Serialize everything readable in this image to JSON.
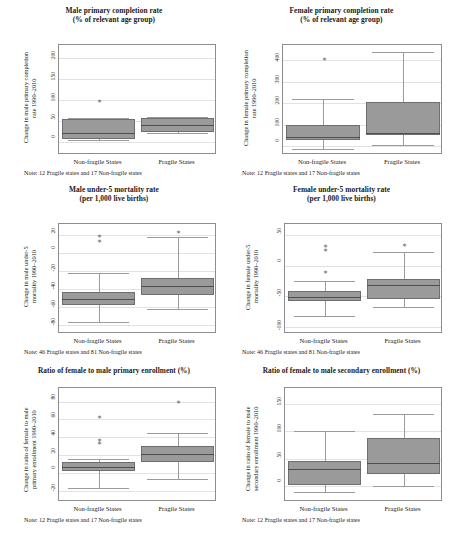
{
  "figure": {
    "panel_count": 6,
    "x_categories": [
      "Non-fragile States",
      "Fragile States"
    ],
    "box_fill_color": "#9a9a9a",
    "box_edge_color": "#6f6f6f",
    "gridline_color": "#e2e2e2",
    "axis_color": "#8d8d8d"
  },
  "panels": [
    {
      "id": "male-primary-completion-rate",
      "title_line1": "Male primary completion rate",
      "title_line2": "(% of relevant age group)",
      "ylabel": "Change in male primary completion\nrate 1990–2010",
      "note": "Note: 12 Fragile states and 17 Non-fragile states",
      "xlabels": [
        "Non-fragile States",
        "Fragile States"
      ]
    },
    {
      "id": "female-primary-completion-rate",
      "title_line1": "Female primary completion rate",
      "title_line2": "(% of relevant age group)",
      "ylabel": "Change in female primary completion\nrate 1990–2010",
      "note": "Note: 12 Fragile states and 17 Non-fragile states",
      "xlabels": [
        "Non-fragile States",
        "Fragile States"
      ]
    },
    {
      "id": "male-under5-mortality-rate",
      "title_line1": "Male under-5 mortality rate",
      "title_line2": "(per 1,000 live births)",
      "ylabel": "Change in male under-5\nmortality 1990–2010",
      "note": "Note: 46 Fragile states and 81 Non-fragile states",
      "xlabels": [
        "Non-fragile States",
        "Fragile States"
      ]
    },
    {
      "id": "female-under5-mortality-rate",
      "title_line1": "Female under-5 mortality rate",
      "title_line2": "(per 1,000 live births)",
      "ylabel": "Change in female under-5\nmortality 1990–2010",
      "note": "Note: 46 Fragile states and 81 Non-fragile states",
      "xlabels": [
        "Non-fragile States",
        "Fragile States"
      ]
    },
    {
      "id": "ratio-female-male-primary-enrollment",
      "title_line1": "Ratio of female to male primary enrollment (%)",
      "title_line2": "",
      "ylabel": "Change in ratio of female to male\nprimary enrollment 1990–2010",
      "note": "Note: 12 Fragile states and 17 Non-fragile states",
      "xlabels": [
        "Non-fragile States",
        "Fragile States"
      ]
    },
    {
      "id": "ratio-female-male-secondary-enrollment",
      "title_line1": "Ratio of female to male secondary enrollment (%)",
      "title_line2": "",
      "ylabel": "Change in ratio of female to male\nsecondary enrollment 1990–2010",
      "note": "Note: 12 Fragile states and 17 Non-fragile states",
      "xlabels": [
        "Non-fragile States",
        "Fragile States"
      ]
    }
  ],
  "chart_data": [
    {
      "type": "box",
      "title": "Male primary completion rate (% of relevant age group)",
      "xlabel": "",
      "ylabel": "Change in male primary completion rate 1990–2010",
      "ticks": [
        0,
        50,
        100,
        150,
        200
      ],
      "ylim": [
        -30,
        230
      ],
      "grid": true,
      "categories": [
        "Non-fragile States",
        "Fragile States"
      ],
      "boxes": [
        {
          "category": "Non-fragile States",
          "min": 5,
          "q1": 8,
          "median": 22,
          "q3": 55,
          "max": 58,
          "outliers": [
            95
          ]
        },
        {
          "category": "Fragile States",
          "min": 22,
          "q1": 25,
          "median": 42,
          "q3": 58,
          "max": 60,
          "outliers": []
        }
      ],
      "note": "Note: 12 Fragile states and 17 Non-fragile states"
    },
    {
      "type": "box",
      "title": "Female primary completion rate (% of relevant age group)",
      "xlabel": "",
      "ylabel": "Change in female primary completion rate 1990–2010",
      "ticks": [
        0,
        100,
        200,
        300,
        400
      ],
      "ylim": [
        -40,
        470
      ],
      "grid": true,
      "categories": [
        "Non-fragile States",
        "Fragile States"
      ],
      "boxes": [
        {
          "category": "Non-fragile States",
          "min": -12,
          "q1": 28,
          "median": 42,
          "q3": 100,
          "max": 218,
          "outliers": [
            400
          ]
        },
        {
          "category": "Fragile States",
          "min": 8,
          "q1": 55,
          "median": 62,
          "q3": 208,
          "max": 440,
          "outliers": []
        }
      ],
      "note": "Note: 12 Fragile states and 17 Non-fragile states"
    },
    {
      "type": "box",
      "title": "Male under-5 mortality rate (per 1,000 live births)",
      "xlabel": "",
      "ylabel": "Change in male under-5 mortality 1990–2010",
      "ticks": [
        -80,
        -60,
        -40,
        -20,
        0,
        20
      ],
      "ylim": [
        -90,
        32
      ],
      "grid": true,
      "categories": [
        "Non-fragile States",
        "Fragile States"
      ],
      "boxes": [
        {
          "category": "Non-fragile States",
          "min": -77,
          "q1": -58,
          "median": -51,
          "q3": -43,
          "max": -22,
          "outliers": [
            18,
            12
          ]
        },
        {
          "category": "Fragile States",
          "min": -62,
          "q1": -47,
          "median": -37,
          "q3": -28,
          "max": 18,
          "outliers": [
            22
          ]
        }
      ],
      "note": "Note: 46 Fragile states and 81 Non-fragile states"
    },
    {
      "type": "box",
      "title": "Female under-5 mortality rate (per 1,000 live births)",
      "xlabel": "",
      "ylabel": "Change in female under-5 mortality 1990–2010",
      "ticks": [
        -100,
        -50,
        0,
        50
      ],
      "ylim": [
        -112,
        68
      ],
      "grid": true,
      "categories": [
        "Non-fragile States",
        "Fragile States"
      ],
      "boxes": [
        {
          "category": "Non-fragile States",
          "min": -82,
          "q1": -58,
          "median": -52,
          "q3": -42,
          "max": -25,
          "outliers": [
            30,
            24,
            -12
          ]
        },
        {
          "category": "Fragile States",
          "min": -68,
          "q1": -54,
          "median": -32,
          "q3": -22,
          "max": 22,
          "outliers": [
            32
          ]
        }
      ],
      "note": "Note: 46 Fragile states and 81 Non-fragile states"
    },
    {
      "type": "box",
      "title": "Ratio of female to male primary enrollment (%)",
      "xlabel": "",
      "ylabel": "Change in ratio of female to male primary enrollment 1990–2010",
      "ticks": [
        -20,
        0,
        20,
        40,
        60,
        80
      ],
      "ylim": [
        -32,
        95
      ],
      "grid": true,
      "categories": [
        "Non-fragile States",
        "Fragile States"
      ],
      "boxes": [
        {
          "category": "Non-fragile States",
          "min": -16,
          "q1": 2,
          "median": 7,
          "q3": 13,
          "max": 16,
          "outliers": [
            62,
            36,
            33
          ]
        },
        {
          "category": "Fragile States",
          "min": -6,
          "q1": 12,
          "median": 22,
          "q3": 30,
          "max": 45,
          "outliers": [
            78
          ]
        }
      ],
      "note": "Note: 12 Fragile states and 17 Non-fragile states"
    },
    {
      "type": "box",
      "title": "Ratio of female to male secondary enrollment (%)",
      "xlabel": "",
      "ylabel": "Change in ratio of female to male secondary enrollment 1990–2010",
      "ticks": [
        0,
        50,
        100,
        150
      ],
      "ylim": [
        -30,
        180
      ],
      "grid": true,
      "categories": [
        "Non-fragile States",
        "Fragile States"
      ],
      "boxes": [
        {
          "category": "Non-fragile States",
          "min": -12,
          "q1": 2,
          "median": 30,
          "q3": 45,
          "max": 100,
          "outliers": []
        },
        {
          "category": "Fragile States",
          "min": 0,
          "q1": 22,
          "median": 42,
          "q3": 88,
          "max": 132,
          "outliers": []
        }
      ],
      "note": "Note: 12 Fragile states and 17 Non-fragile states"
    }
  ]
}
